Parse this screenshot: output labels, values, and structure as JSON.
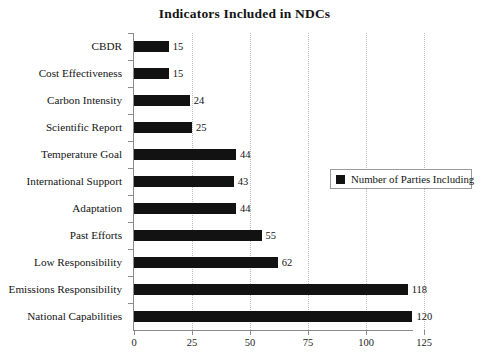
{
  "chart_data": {
    "type": "bar",
    "orientation": "horizontal",
    "title": "Indicators Included in NDCs",
    "xlabel": "",
    "ylabel": "",
    "xlim": [
      0,
      125
    ],
    "ylim": null,
    "grid": "vertical-dotted",
    "legend_position": "middle-right",
    "categories": [
      "CBDR",
      "Cost Effectiveness",
      "Carbon Intensity",
      "Scientific Report",
      "Temperature Goal",
      "International Support",
      "Adaptation",
      "Past Efforts",
      "Low Responsibility",
      "Emissions Responsibility",
      "National Capabilities"
    ],
    "values": [
      15,
      15,
      24,
      25,
      44,
      43,
      44,
      55,
      62,
      118,
      120
    ],
    "series": [
      {
        "name": "Number of Parties Including",
        "color": "#121212",
        "values": [
          15,
          15,
          24,
          25,
          44,
          43,
          44,
          55,
          62,
          118,
          120
        ]
      }
    ],
    "xticks": [
      0,
      25,
      50,
      75,
      100,
      125
    ],
    "xtick_labels": [
      "0",
      "25",
      "50",
      "75",
      "100",
      "125"
    ],
    "data_labels": [
      "15",
      "15",
      "24",
      "25",
      "44",
      "43",
      "44",
      "55",
      "62",
      "118",
      "120"
    ]
  },
  "legend": {
    "entries": [
      {
        "label": "Number of Parties Including",
        "swatch": "legend-swatch-icon"
      }
    ]
  },
  "colors": {
    "bar": "#121212",
    "axis": "#8a8a8a",
    "grid": "#bcbcbc",
    "text": "#141414",
    "background": "#ffffff"
  }
}
